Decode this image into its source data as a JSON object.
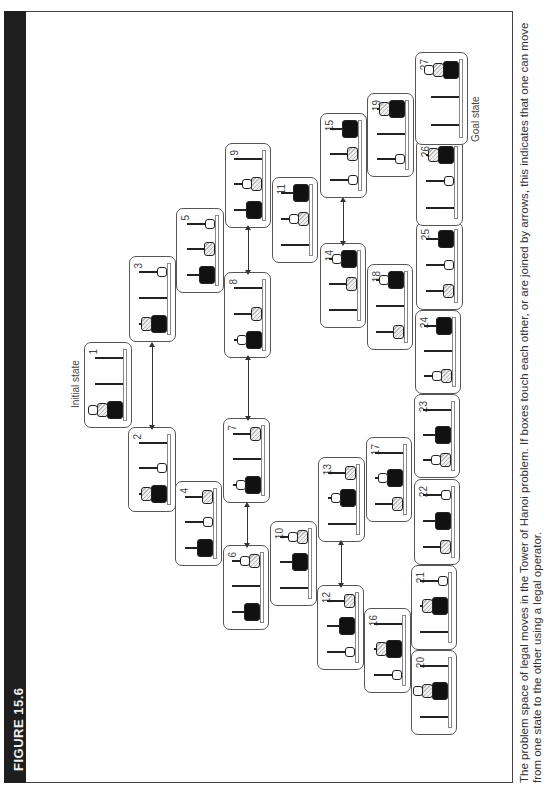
{
  "figure": {
    "title": "FIGURE 15.6",
    "caption": "The problem space of legal moves in the Tower of Hanoi problem. If boxes touch each other, or are joined by arrows, this indicates that one can move from one state to the other using a legal operator.",
    "initial_label": "Initial state",
    "goal_label": "Goal state",
    "legend": {
      "small_disk": "white",
      "medium_disk": "hatched",
      "large_disk": "black",
      "pegs_order": [
        "A (left)",
        "B (middle)",
        "C (right)"
      ]
    }
  },
  "states": [
    {
      "id": "1",
      "pos": [
        362,
        84,
        86,
        48
      ],
      "small": "A",
      "medium": "A",
      "large": "A"
    },
    {
      "id": "2",
      "pos": [
        278,
        128,
        85,
        48
      ],
      "small": "B",
      "medium": "A",
      "large": "A"
    },
    {
      "id": "3",
      "pos": [
        448,
        129,
        86,
        47
      ],
      "small": "C",
      "medium": "A",
      "large": "A"
    },
    {
      "id": "4",
      "pos": [
        224,
        175,
        85,
        47
      ],
      "small": "B",
      "medium": "C",
      "large": "A"
    },
    {
      "id": "5",
      "pos": [
        497,
        176,
        85,
        48
      ],
      "small": "C",
      "medium": "B",
      "large": "A"
    },
    {
      "id": "6",
      "pos": [
        160,
        223,
        85,
        46
      ],
      "small": "C",
      "medium": "C",
      "large": "A"
    },
    {
      "id": "7",
      "pos": [
        287,
        223,
        85,
        47
      ],
      "small": "A",
      "medium": "C",
      "large": "A"
    },
    {
      "id": "8",
      "pos": [
        432,
        224,
        86,
        47
      ],
      "small": "A",
      "medium": "B",
      "large": "A"
    },
    {
      "id": "9",
      "pos": [
        562,
        225,
        85,
        46
      ],
      "small": "B",
      "medium": "B",
      "large": "A"
    },
    {
      "id": "10",
      "pos": [
        184,
        270,
        85,
        47
      ],
      "small": "C",
      "medium": "C",
      "large": "B"
    },
    {
      "id": "11",
      "pos": [
        527,
        272,
        86,
        46
      ],
      "small": "B",
      "medium": "B",
      "large": "C"
    },
    {
      "id": "12",
      "pos": [
        120,
        317,
        85,
        47
      ],
      "small": "A",
      "medium": "C",
      "large": "B"
    },
    {
      "id": "13",
      "pos": [
        248,
        318,
        85,
        47
      ],
      "small": "B",
      "medium": "C",
      "large": "B"
    },
    {
      "id": "14",
      "pos": [
        462,
        320,
        85,
        46
      ],
      "small": "C",
      "medium": "B",
      "large": "C"
    },
    {
      "id": "15",
      "pos": [
        592,
        320,
        85,
        47
      ],
      "small": "A",
      "medium": "B",
      "large": "C"
    },
    {
      "id": "16",
      "pos": [
        97,
        364,
        85,
        47
      ],
      "small": "A",
      "medium": "B",
      "large": "B"
    },
    {
      "id": "17",
      "pos": [
        268,
        366,
        85,
        46
      ],
      "small": "B",
      "medium": "A",
      "large": "B"
    },
    {
      "id": "18",
      "pos": [
        440,
        367,
        86,
        46
      ],
      "small": "C",
      "medium": "A",
      "large": "C"
    },
    {
      "id": "19",
      "pos": [
        613,
        367,
        84,
        47
      ],
      "small": "A",
      "medium": "C",
      "large": "C"
    },
    {
      "id": "20",
      "pos": [
        55,
        411,
        85,
        46
      ],
      "small": "B",
      "medium": "B",
      "large": "B"
    },
    {
      "id": "21",
      "pos": [
        140,
        411,
        85,
        46
      ],
      "small": "C",
      "medium": "B",
      "large": "B"
    },
    {
      "id": "22",
      "pos": [
        225,
        414,
        86,
        46
      ],
      "small": "C",
      "medium": "A",
      "large": "B"
    },
    {
      "id": "23",
      "pos": [
        312,
        414,
        84,
        46
      ],
      "small": "A",
      "medium": "A",
      "large": "B"
    },
    {
      "id": "24",
      "pos": [
        396,
        415,
        84,
        46
      ],
      "small": "A",
      "medium": "A",
      "large": "C"
    },
    {
      "id": "25",
      "pos": [
        480,
        416,
        88,
        47
      ],
      "small": "B",
      "medium": "A",
      "large": "C"
    },
    {
      "id": "26",
      "pos": [
        564,
        416,
        87,
        47
      ],
      "small": "B",
      "medium": "C",
      "large": "C"
    },
    {
      "id": "27",
      "pos": [
        645,
        415,
        93,
        53
      ],
      "small": "C",
      "medium": "C",
      "large": "C"
    }
  ],
  "arrows": [
    {
      "from": "2",
      "to": "3",
      "u1": 363,
      "u2": 445,
      "v": 152
    },
    {
      "from": "8",
      "to": "9",
      "u1": 518,
      "u2": 562,
      "v": 248
    },
    {
      "from": "7",
      "to": "8",
      "u1": 372,
      "u2": 432,
      "v": 248
    },
    {
      "from": "6",
      "to": "7",
      "u1": 245,
      "u2": 285,
      "v": 247
    },
    {
      "from": "14",
      "to": "15",
      "u1": 547,
      "u2": 590,
      "v": 343
    },
    {
      "from": "12",
      "to": "13",
      "u1": 205,
      "u2": 247,
      "v": 341
    }
  ],
  "labels": {
    "initial": {
      "u": 382,
      "v": 70
    },
    "goal": {
      "u": 648,
      "v": 470
    }
  }
}
